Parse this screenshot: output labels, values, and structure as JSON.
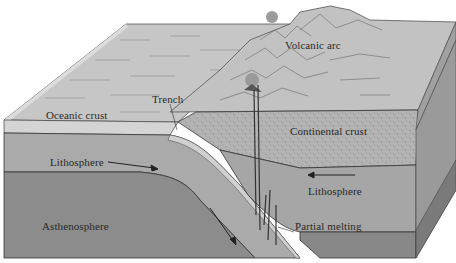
{
  "diagram": {
    "type": "block-diagram",
    "labels": {
      "volcanic_arc": "Volcanic arc",
      "trench": "Trench",
      "oceanic_crust": "Oceanic crust",
      "continental_crust": "Continental crust",
      "lithosphere_left": "Lithosphere",
      "lithosphere_right": "Lithosphere",
      "asthenosphere": "Asthenosphere",
      "partial_melting": "Partial melting"
    },
    "arrows": [
      {
        "id": "oceanic-lithosphere-motion",
        "direction": "right-toward-trench"
      },
      {
        "id": "continental-lithosphere-motion",
        "direction": "left-toward-trench"
      },
      {
        "id": "subducting-slab-motion",
        "direction": "down-right"
      }
    ],
    "colors": {
      "ocean_surface": "#c4c4c4",
      "oceanic_crust_edge": "#d2d2d2",
      "lithosphere": "#a8a8a8",
      "asthenosphere": "#8a8a8a",
      "continental_crust": "#b4b4b4",
      "side_face": "#9a9a9a",
      "side_face_dark": "#7a7a7a",
      "outline": "#333333"
    }
  }
}
